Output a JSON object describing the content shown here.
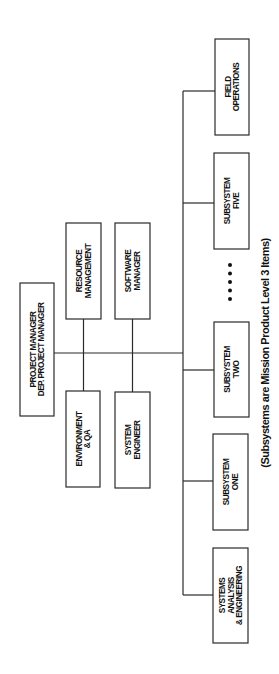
{
  "diagram": {
    "type": "org-chart",
    "orientation": "rotated-90-ccw",
    "root": {
      "id": "project-manager",
      "lines": [
        "PROJECT MANAGER",
        "DEP. PROJECT MANAGER"
      ]
    },
    "staff": [
      {
        "id": "resource-management",
        "lines": [
          "RESOURCE",
          "MANAGEMENT"
        ]
      },
      {
        "id": "software-manager",
        "lines": [
          "SOFTWARE",
          "MANAGER"
        ]
      },
      {
        "id": "environment-qa",
        "lines": [
          "ENVIRONMENT",
          "& QA"
        ]
      },
      {
        "id": "system-engineer",
        "lines": [
          "SYSTEM",
          "ENGINEER"
        ]
      }
    ],
    "subordinates": [
      {
        "id": "systems-analysis-engineering",
        "lines": [
          "SYSTEMS",
          "ANALYSIS",
          "& ENGINEERING"
        ]
      },
      {
        "id": "subsystem-one",
        "lines": [
          "SUBSYSTEM",
          "ONE"
        ]
      },
      {
        "id": "subsystem-two",
        "lines": [
          "SUBSYSTEM",
          "TWO"
        ]
      },
      {
        "id": "subsystem-five",
        "lines": [
          "SUBSYSTEM",
          "FIVE"
        ]
      },
      {
        "id": "field-operations",
        "lines": [
          "FIELD",
          "OPERATIONS"
        ]
      }
    ],
    "ellipsis": "•••••",
    "caption": "(Subsystems are Mission Product Level 3 Items)"
  }
}
